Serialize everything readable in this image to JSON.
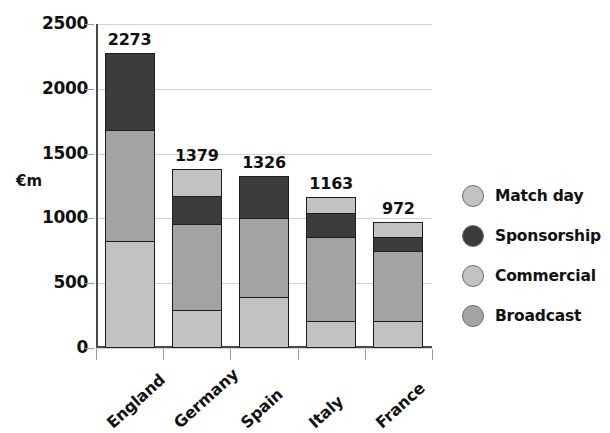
{
  "chart_data": {
    "type": "bar",
    "subtype": "stacked-bar",
    "title": "",
    "xlabel": "",
    "ylabel": "€m",
    "ylim": [
      0,
      2500
    ],
    "yticks": [
      0,
      500,
      1000,
      1500,
      2000,
      2500
    ],
    "ytick_labels": [
      "0",
      "500",
      "1000",
      "1500",
      "2000",
      "2500"
    ],
    "grid": true,
    "legend_position": "right",
    "categories": [
      "England",
      "Germany",
      "Spain",
      "Italy",
      "France"
    ],
    "series": [
      {
        "name": "Match day",
        "color": "#c2c2c2",
        "values": [
          0,
          210,
          0,
          125,
          115
        ]
      },
      {
        "name": "Sponsorship",
        "color": "#3c3c3c",
        "values": [
          593,
          215,
          324,
          185,
          115
        ]
      },
      {
        "name": "Commercial",
        "color": "#a3a3a3",
        "values": [
          862,
          675,
          620,
          655,
          545
        ]
      },
      {
        "name": "Broadcast",
        "color": "#c2c2c2",
        "values": [
          818,
          279,
          382,
          198,
          197
        ]
      }
    ],
    "totals": [
      2273,
      1379,
      1326,
      1163,
      972
    ],
    "total_labels": [
      "2273",
      "1379",
      "1326",
      "1163",
      "972"
    ],
    "colors": {
      "dark_gray": "#3c3c3c",
      "medium_gray": "#a3a3a3",
      "light_gray": "#c2c2c2",
      "axis": "#4a4a4a",
      "gridline": "#d2d2d2",
      "segment_border": "#1d1d1d"
    }
  },
  "legend": {
    "items": [
      {
        "label": "Match day",
        "color": "#c2c2c2"
      },
      {
        "label": "Sponsorship",
        "color": "#3c3c3c"
      },
      {
        "label": "Commercial",
        "color": "#c2c2c2"
      },
      {
        "label": "Broadcast",
        "color": "#a3a3a3"
      }
    ]
  }
}
